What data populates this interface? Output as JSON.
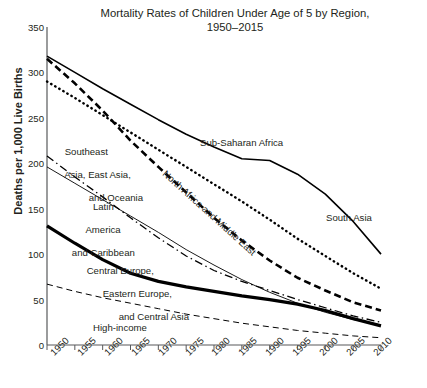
{
  "chart_data": {
    "type": "line",
    "title": "Mortality Rates of Children Under Age of 5 by Region, 1950–2015",
    "title_line1": "Mortality Rates of Children Under Age of 5 by Region,",
    "title_line2": "1950–2015",
    "xlabel": "",
    "ylabel": "Deaths per 1,000 Live Births",
    "xlim": [
      1950,
      2010
    ],
    "ylim": [
      0,
      350
    ],
    "yticks": [
      0,
      50,
      100,
      150,
      200,
      250,
      300,
      350
    ],
    "xticks": [
      1950,
      1955,
      1960,
      1965,
      1970,
      1975,
      1980,
      1985,
      1990,
      1995,
      2000,
      2005,
      2010
    ],
    "grid": false,
    "legend": "inline-annotations",
    "x": [
      1950,
      1955,
      1960,
      1965,
      1970,
      1975,
      1980,
      1985,
      1990,
      1995,
      2000,
      2005,
      2010
    ],
    "series": [
      {
        "name": "Sub-Saharan Africa",
        "style": "solid",
        "width": 1.6,
        "color": "#000000",
        "values": [
          318,
          300,
          282,
          265,
          248,
          232,
          218,
          205,
          203,
          188,
          166,
          136,
          100
        ]
      },
      {
        "name": "North Africa and Middle East",
        "style": "dashed-heavy",
        "width": 2.6,
        "color": "#000000",
        "values": [
          315,
          288,
          258,
          225,
          196,
          168,
          140,
          115,
          93,
          74,
          60,
          47,
          38
        ]
      },
      {
        "name": "South Asia",
        "style": "dotted",
        "width": 2.4,
        "color": "#000000",
        "values": [
          290,
          272,
          253,
          234,
          215,
          196,
          177,
          158,
          138,
          117,
          98,
          79,
          62
        ]
      },
      {
        "name": "Southeast Asia, East Asia, and Oceania",
        "style": "dash-dot",
        "width": 1.3,
        "color": "#000000",
        "values": [
          208,
          185,
          163,
          140,
          118,
          98,
          82,
          70,
          60,
          50,
          41,
          32,
          25
        ]
      },
      {
        "name": "Latin America and Caribbean",
        "style": "solid-thin",
        "width": 0.9,
        "color": "#000000",
        "values": [
          196,
          178,
          160,
          142,
          124,
          105,
          88,
          72,
          58,
          46,
          36,
          28,
          22
        ]
      },
      {
        "name": "Central Europe, Eastern Europe, and Central Asia",
        "style": "solid-thick",
        "width": 3.2,
        "color": "#000000",
        "values": [
          131,
          112,
          94,
          79,
          70,
          64,
          59,
          54,
          50,
          45,
          38,
          29,
          21
        ]
      },
      {
        "name": "High-income",
        "style": "dashed-thin",
        "width": 1.0,
        "color": "#000000",
        "values": [
          67,
          59,
          52,
          46,
          40,
          34,
          29,
          24,
          20,
          16,
          13,
          10,
          8
        ]
      }
    ],
    "annotations": [
      {
        "id": "sub-saharan-africa",
        "text": "Sub-Saharan Africa"
      },
      {
        "id": "south-asia",
        "text": "South Asia"
      },
      {
        "id": "north-africa-middle-east",
        "text": "North Africa and Middle East"
      },
      {
        "id": "southeast-asia",
        "line1": "Southeast",
        "line2": "Asia, East Asia,",
        "line3": "and Oceania"
      },
      {
        "id": "latin-america",
        "line1": "Latin",
        "line2": "America",
        "line3": "and Caribbean"
      },
      {
        "id": "central-europe",
        "line1": "Central Europe,",
        "line2": "Eastern Europe,",
        "line3": "and Central Asia"
      },
      {
        "id": "high-income",
        "text": "High-income"
      }
    ]
  },
  "axis": {
    "y": {
      "t0": "0",
      "t1": "50",
      "t2": "100",
      "t3": "150",
      "t4": "200",
      "t5": "250",
      "t6": "300",
      "t7": "350"
    },
    "x": {
      "t0": "1950",
      "t1": "1955",
      "t2": "1960",
      "t3": "1965",
      "t4": "1970",
      "t5": "1975",
      "t6": "1980",
      "t7": "1985",
      "t8": "1990",
      "t9": "1995",
      "t10": "2000",
      "t11": "2005",
      "t12": "2010"
    }
  }
}
